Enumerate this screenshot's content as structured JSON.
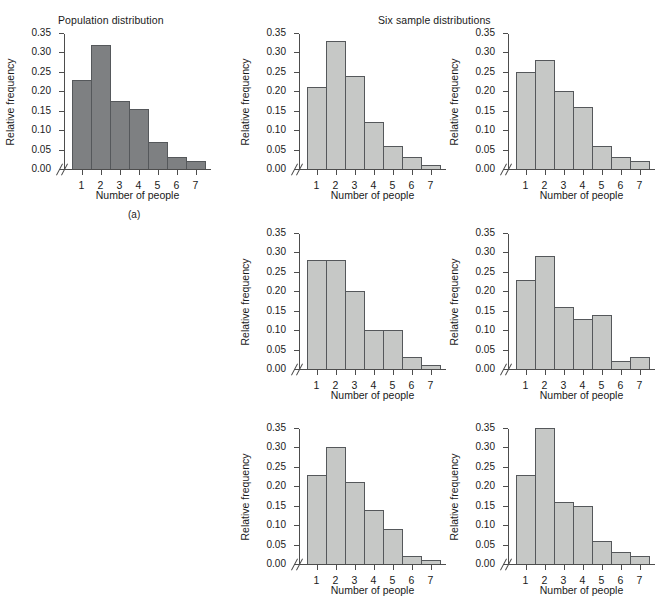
{
  "figure": {
    "population_title": "Population distribution",
    "samples_title": "Six sample distributions",
    "panel_caption": "(a)",
    "axis": {
      "ylabel": "Relative frequency",
      "xlabel": "Number of people",
      "ytick_labels": [
        "0.00",
        "0.05",
        "0.10",
        "0.15",
        "0.20",
        "0.25",
        "0.30",
        "0.35"
      ],
      "xtick_labels": [
        "1",
        "2",
        "3",
        "4",
        "5",
        "6",
        "7"
      ],
      "ymin": 0.0,
      "ymax": 0.35,
      "break_marker": "//"
    },
    "colors": {
      "population_bar": "#7e8082",
      "sample_bar": "#c6c8c6",
      "bar_outline": "#55585b",
      "axis": "#4d4d4d",
      "text": "#1a1a1a",
      "background": "#ffffff"
    }
  },
  "chart_data": [
    {
      "type": "bar",
      "title": "Population distribution",
      "xlabel": "Number of people",
      "ylabel": "Relative frequency",
      "categories": [
        "1",
        "2",
        "3",
        "4",
        "5",
        "6",
        "7"
      ],
      "values": [
        0.23,
        0.32,
        0.175,
        0.155,
        0.07,
        0.03,
        0.02
      ],
      "ylim": [
        0.0,
        0.35
      ],
      "grid": false,
      "legend": "none",
      "series_role": "population"
    },
    {
      "type": "bar",
      "title": "Sample 1",
      "xlabel": "Number of people",
      "ylabel": "Relative frequency",
      "categories": [
        "1",
        "2",
        "3",
        "4",
        "5",
        "6",
        "7"
      ],
      "values": [
        0.21,
        0.33,
        0.24,
        0.12,
        0.06,
        0.03,
        0.01
      ],
      "ylim": [
        0.0,
        0.35
      ],
      "grid": false,
      "legend": "none",
      "series_role": "sample"
    },
    {
      "type": "bar",
      "title": "Sample 2",
      "xlabel": "Number of people",
      "ylabel": "Relative frequency",
      "categories": [
        "1",
        "2",
        "3",
        "4",
        "5",
        "6",
        "7"
      ],
      "values": [
        0.25,
        0.28,
        0.2,
        0.16,
        0.06,
        0.03,
        0.02
      ],
      "ylim": [
        0.0,
        0.35
      ],
      "grid": false,
      "legend": "none",
      "series_role": "sample"
    },
    {
      "type": "bar",
      "title": "Sample 3",
      "xlabel": "Number of people",
      "ylabel": "Relative frequency",
      "categories": [
        "1",
        "2",
        "3",
        "4",
        "5",
        "6",
        "7"
      ],
      "values": [
        0.28,
        0.28,
        0.2,
        0.1,
        0.1,
        0.03,
        0.01
      ],
      "ylim": [
        0.0,
        0.35
      ],
      "grid": false,
      "legend": "none",
      "series_role": "sample"
    },
    {
      "type": "bar",
      "title": "Sample 4",
      "xlabel": "Number of people",
      "ylabel": "Relative frequency",
      "categories": [
        "1",
        "2",
        "3",
        "4",
        "5",
        "6",
        "7"
      ],
      "values": [
        0.23,
        0.29,
        0.16,
        0.13,
        0.14,
        0.02,
        0.03
      ],
      "ylim": [
        0.0,
        0.35
      ],
      "grid": false,
      "legend": "none",
      "series_role": "sample"
    },
    {
      "type": "bar",
      "title": "Sample 5",
      "xlabel": "Number of people",
      "ylabel": "Relative frequency",
      "categories": [
        "1",
        "2",
        "3",
        "4",
        "5",
        "6",
        "7"
      ],
      "values": [
        0.23,
        0.3,
        0.21,
        0.14,
        0.09,
        0.02,
        0.01
      ],
      "ylim": [
        0.0,
        0.35
      ],
      "grid": false,
      "legend": "none",
      "series_role": "sample"
    },
    {
      "type": "bar",
      "title": "Sample 6",
      "xlabel": "Number of people",
      "ylabel": "Relative frequency",
      "categories": [
        "1",
        "2",
        "3",
        "4",
        "5",
        "6",
        "7"
      ],
      "values": [
        0.23,
        0.35,
        0.16,
        0.15,
        0.06,
        0.03,
        0.02
      ],
      "ylim": [
        0.0,
        0.35
      ],
      "grid": false,
      "legend": "none",
      "series_role": "sample"
    }
  ]
}
